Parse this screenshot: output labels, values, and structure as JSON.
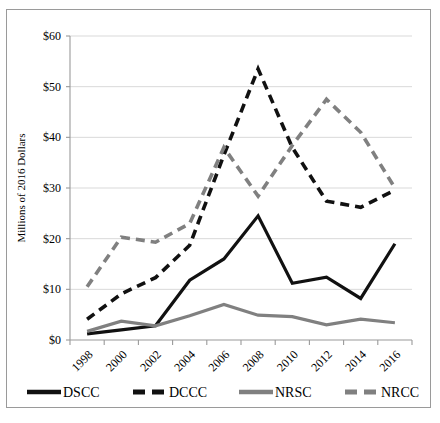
{
  "chart_data": {
    "type": "line",
    "title": "",
    "xlabel": "",
    "ylabel": "Millions of 2016 Dollars",
    "x": [
      1998,
      2000,
      2002,
      2004,
      2006,
      2008,
      2010,
      2012,
      2014,
      2016
    ],
    "categories": [
      "1998",
      "2000",
      "2002",
      "2004",
      "2006",
      "2008",
      "2010",
      "2012",
      "2014",
      "2016"
    ],
    "ylim": [
      0,
      60
    ],
    "ytick_values": [
      0,
      10,
      20,
      30,
      40,
      50,
      60
    ],
    "ytick_labels": [
      "$0",
      "$10",
      "$20",
      "$30",
      "$40",
      "$50",
      "$60"
    ],
    "grid": true,
    "legend_position": "bottom",
    "series": [
      {
        "name": "DSCC",
        "style": "solid",
        "color": "#111111",
        "values": [
          1.2,
          2.0,
          2.8,
          11.8,
          16.0,
          24.5,
          11.2,
          12.4,
          8.2,
          19.0
        ]
      },
      {
        "name": "DCCC",
        "style": "dashed",
        "color": "#111111",
        "values": [
          4.1,
          9.1,
          12.3,
          18.7,
          36.5,
          53.5,
          38.0,
          27.4,
          26.2,
          29.6
        ]
      },
      {
        "name": "NRSC",
        "style": "solid",
        "color": "#808080",
        "values": [
          1.7,
          3.7,
          2.8,
          4.8,
          7.0,
          4.9,
          4.6,
          3.0,
          4.1,
          3.4
        ]
      },
      {
        "name": "NRCC",
        "style": "dashed",
        "color": "#808080",
        "values": [
          10.5,
          20.3,
          19.3,
          23.0,
          38.0,
          28.4,
          38.4,
          47.5,
          41.0,
          30.0
        ]
      }
    ]
  },
  "legend": {
    "entries": [
      {
        "label": "DSCC",
        "style": "solid",
        "color": "#111111"
      },
      {
        "label": "DCCC",
        "style": "dashed",
        "color": "#111111"
      },
      {
        "label": "NRSC",
        "style": "solid",
        "color": "#808080"
      },
      {
        "label": "NRCC",
        "style": "dashed",
        "color": "#808080"
      }
    ]
  },
  "colors": {
    "black_series": "#111111",
    "gray_series": "#808080",
    "gridline": "#d9d9d9",
    "axis": "#9a9a9a",
    "frame": "#9a9a9a",
    "background": "#ffffff"
  }
}
